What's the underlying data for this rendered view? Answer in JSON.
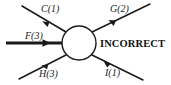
{
  "figure": {
    "type": "force-diagram",
    "background_color": "#ffffff",
    "stroke_color": "#1a1a1a",
    "node": {
      "shape": "circle",
      "center_x": 79,
      "center_y": 43,
      "radius": 17,
      "fill": "#ffffff",
      "stroke": "#1a1a1a"
    },
    "verdict": {
      "label": "INCORRECT",
      "color": "#111111"
    },
    "arrows": [
      {
        "id": "arrow-c",
        "label": "C(1)",
        "magnitude": 1,
        "direction": "incoming",
        "origin": "upper-left",
        "x1": 22,
        "y1": 6,
        "x2": 66,
        "y2": 32,
        "arrowhead_at": 0.62,
        "thickness": 1.5
      },
      {
        "id": "arrow-f",
        "label": "F(3)",
        "magnitude": 3,
        "direction": "incoming",
        "origin": "left",
        "x1": 6,
        "y1": 43,
        "x2": 62,
        "y2": 43,
        "arrowhead_at": 0.66,
        "thickness": 3.2
      },
      {
        "id": "arrow-h",
        "label": "H(3)",
        "magnitude": 3,
        "direction": "incoming",
        "origin": "lower-left",
        "x1": 19,
        "y1": 79,
        "x2": 66,
        "y2": 55,
        "arrowhead_at": 0.64,
        "thickness": 1.5
      },
      {
        "id": "arrow-g",
        "label": "G(2)",
        "magnitude": 2,
        "direction": "outgoing",
        "origin": "upper-right",
        "x1": 92,
        "y1": 32,
        "x2": 150,
        "y2": 4,
        "arrowhead_at": 0.42,
        "thickness": 1.5
      },
      {
        "id": "arrow-i",
        "label": "I(1)",
        "magnitude": 1,
        "direction": "outgoing",
        "origin": "lower-right",
        "x1": 92,
        "y1": 55,
        "x2": 143,
        "y2": 80,
        "arrowhead_at": 0.36,
        "thickness": 1.5
      }
    ]
  }
}
